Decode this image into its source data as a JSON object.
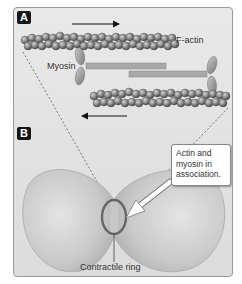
{
  "figure": {
    "panels": [
      {
        "id": "A",
        "label": "A"
      },
      {
        "id": "B",
        "label": "B"
      }
    ],
    "panel_a": {
      "labels": {
        "f_actin": "F-actin",
        "myosin": "Myosin"
      },
      "arrows": [
        {
          "name": "top-arrow",
          "direction": "right"
        },
        {
          "name": "bottom-arrow",
          "direction": "left"
        }
      ]
    },
    "panel_b": {
      "callout_lines": [
        "Actin and",
        "myosin in",
        "association."
      ],
      "ring_label": "Contractile ring"
    },
    "colors": {
      "actin_bead": "#8a8a8a",
      "myosin_tail": "#a6a6a6",
      "cell_body": "#c6c6c6",
      "ring": "#6a6a6a",
      "panel_label_bg": "#151515"
    }
  }
}
